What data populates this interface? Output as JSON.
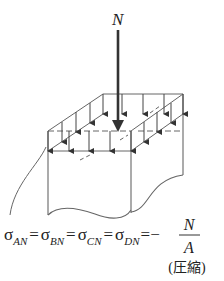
{
  "diagram": {
    "load_label": "N",
    "stress_block_arrows": 16,
    "formula": {
      "symbol": "σ",
      "terms": [
        {
          "sub": "AN"
        },
        {
          "sub": "BN"
        },
        {
          "sub": "CN"
        },
        {
          "sub": "DN"
        }
      ],
      "equals": "=",
      "minus": "−",
      "numerator": "N",
      "denominator": "A",
      "note": "(圧縮)"
    },
    "colors": {
      "line": "#555555",
      "text": "#222222",
      "load_arrow": "#333333"
    }
  }
}
